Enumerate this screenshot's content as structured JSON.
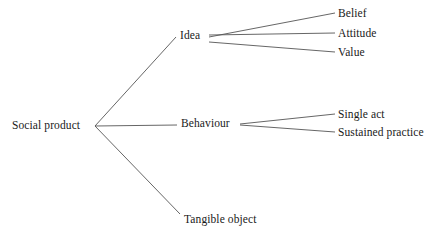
{
  "diagram": {
    "type": "tree",
    "background_color": "#ffffff",
    "line_color": "#555555",
    "text_color": "#1a1a1a",
    "root": {
      "label": "Social product"
    },
    "branches": [
      {
        "label": "Idea",
        "children": [
          {
            "label": "Belief"
          },
          {
            "label": "Attitude"
          },
          {
            "label": "Value"
          }
        ]
      },
      {
        "label": "Behaviour",
        "children": [
          {
            "label": "Single act"
          },
          {
            "label": "Sustained practice"
          }
        ]
      },
      {
        "label": "Tangible object",
        "children": []
      }
    ],
    "edges": [
      {
        "name": "root-to-idea",
        "x1": 95,
        "y1": 126,
        "x2": 176,
        "y2": 37
      },
      {
        "name": "root-to-behaviour",
        "x1": 95,
        "y1": 126,
        "x2": 177,
        "y2": 125
      },
      {
        "name": "root-to-tangible",
        "x1": 95,
        "y1": 126,
        "x2": 180,
        "y2": 214
      },
      {
        "name": "idea-to-belief",
        "x1": 209,
        "y1": 37,
        "x2": 335,
        "y2": 13
      },
      {
        "name": "idea-to-attitude",
        "x1": 209,
        "y1": 35,
        "x2": 335,
        "y2": 33
      },
      {
        "name": "idea-to-value",
        "x1": 209,
        "y1": 42,
        "x2": 335,
        "y2": 52
      },
      {
        "name": "behaviour-to-single-act",
        "x1": 240,
        "y1": 124,
        "x2": 335,
        "y2": 114
      },
      {
        "name": "behaviour-to-sustained",
        "x1": 240,
        "y1": 125,
        "x2": 335,
        "y2": 132
      }
    ]
  }
}
